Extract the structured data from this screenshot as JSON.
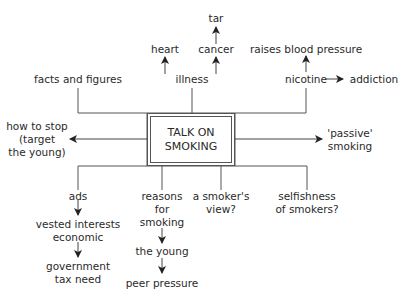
{
  "center": {
    "line1": "TALK ON",
    "line2": "SMOKING"
  },
  "top": {
    "facts": "facts and figures",
    "illness": "illness",
    "heart": "heart",
    "cancer": "cancer",
    "tar": "tar",
    "nicotine": "nicotine",
    "blood_pressure": "raises blood pressure",
    "addiction": "addiction"
  },
  "left": {
    "line1": "how to stop",
    "line2": "(target",
    "line3": "the young)"
  },
  "right": {
    "line1": "'passive'",
    "line2": "smoking"
  },
  "bottom": {
    "ads": "ads",
    "vested1": "vested interests",
    "vested2": "economic",
    "gov1": "government",
    "gov2": "tax need",
    "reasons1": "reasons",
    "reasons2": "for",
    "reasons3": "smoking",
    "young": "the young",
    "peer": "peer pressure",
    "smoker1": "a smoker's",
    "smoker2": "view?",
    "selfish1": "selfishness",
    "selfish2": "of smokers?"
  },
  "colors": {
    "line": "#555555",
    "text": "#2a2a2a",
    "background": "#ffffff"
  }
}
